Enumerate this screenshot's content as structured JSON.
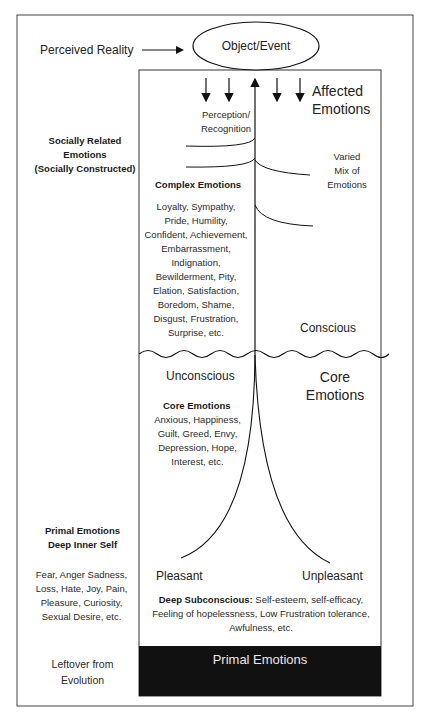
{
  "top": {
    "perceived_reality": "Perceived Reality",
    "object_event": "Object/Event"
  },
  "right": {
    "affected_emotions": [
      "Affected",
      "Emotions"
    ],
    "varied_mix": [
      "Varied",
      "Mix of",
      "Emotions"
    ],
    "conscious": "Conscious",
    "core_emotions": [
      "Core",
      "Emotions"
    ],
    "unpleasant": "Unpleasant"
  },
  "center": {
    "perception": [
      "Perception/",
      "Recognition"
    ],
    "complex_title": "Complex Emotions",
    "complex_list": [
      "Loyalty, Sympathy,",
      "Pride, Humility,",
      "Confident, Achievement,",
      "Embarrassment,",
      "Indignation,",
      "Bewilderment, Pity,",
      "Elation, Satisfaction,",
      "Boredom, Shame,",
      "Disgust, Frustration,",
      "Surprise, etc."
    ],
    "unconscious": "Unconscious",
    "core_title": "Core Emotions",
    "core_list": [
      "Anxious, Happiness,",
      "Guilt, Greed, Envy,",
      "Depression, Hope,",
      "Interest, etc."
    ],
    "pleasant": "Pleasant",
    "deep_subconscious_label": "Deep Subconscious:",
    "deep_subconscious_lines": [
      " Self-esteem, self-efficacy,",
      "Feeling of hopelessness, Low Frustration tolerance,",
      "Awfulness, etc."
    ],
    "primal_bar": "Primal Emotions"
  },
  "left": {
    "social_title": [
      "Socially Related",
      "Emotions",
      "(Socially Constructed)"
    ],
    "primal_title": [
      "Primal Emotions",
      "Deep Inner Self"
    ],
    "primal_list": [
      "Fear, Anger Sadness,",
      "Loss, Hate,  Joy, Pain,",
      "Pleasure, Curiosity,",
      "Sexual Desire, etc."
    ],
    "leftover": [
      "Leftover from",
      "Evolution"
    ]
  }
}
